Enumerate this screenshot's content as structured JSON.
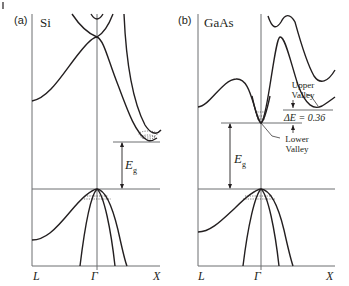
{
  "figure": {
    "type": "band structure diagram",
    "corner_mark": "|",
    "panels": [
      {
        "tag": "(a)",
        "material": "Si",
        "axis_labels": [
          "L",
          "Γ",
          "X"
        ],
        "gap_label": "E",
        "gap_label_sub": "g",
        "notes": "Indirect gap: conduction band minimum near X (filled electron pocket), valence band maximum at Γ with holes"
      },
      {
        "tag": "(b)",
        "material": "GaAs",
        "axis_labels": [
          "L",
          "Γ",
          "X"
        ],
        "gap_label": "E",
        "gap_label_sub": "g",
        "upper_valley_label_1": "Upper",
        "upper_valley_label_2": "Valley",
        "lower_valley_label_1": "Lower",
        "lower_valley_label_2": "Valley",
        "delta_e_label": "ΔE = 0.36",
        "notes": "Direct gap at Γ; upper valley offset ΔE = 0.36"
      }
    ],
    "colors": {
      "curve": "#231f20",
      "axis": "#6d6e71"
    }
  }
}
